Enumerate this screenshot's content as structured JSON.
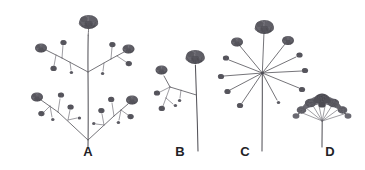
{
  "figure": {
    "background_color": "#ffffff",
    "ink_color": "#55545a",
    "head_color": "#6b6a71",
    "width": 365,
    "height": 170,
    "style": "grayscale pen-and-ink botanical line drawing"
  },
  "labels": [
    {
      "id": "A",
      "text": "A",
      "x": 88,
      "y": 156
    },
    {
      "id": "B",
      "text": "B",
      "x": 180,
      "y": 156
    },
    {
      "id": "C",
      "text": "C",
      "x": 245,
      "y": 156
    },
    {
      "id": "D",
      "text": "D",
      "x": 330,
      "y": 156
    }
  ],
  "specimens": [
    {
      "id": "A",
      "name": "compound-branched-inflorescence",
      "label": "A",
      "stem_base": {
        "x": 88,
        "y": 146
      },
      "stem_top": {
        "x": 88,
        "y": 36
      },
      "node_levels": 2,
      "terminal_head": {
        "x": 88,
        "y": 24,
        "size": 11
      },
      "branch_nodes": [
        {
          "x": 88,
          "y": 72,
          "spread": "opposite-pair"
        },
        {
          "x": 88,
          "y": 128,
          "spread": "opposite-pair"
        }
      ],
      "head_count": 14
    },
    {
      "id": "B",
      "name": "simple-branched-inflorescence",
      "label": "B",
      "stem_base": {
        "x": 198,
        "y": 150
      },
      "stem_top": {
        "x": 196,
        "y": 66
      },
      "terminal_head": {
        "x": 195,
        "y": 57,
        "size": 10
      },
      "branch_nodes": [
        {
          "x": 196,
          "y": 94,
          "spread": "single-left"
        }
      ],
      "head_count": 6
    },
    {
      "id": "C",
      "name": "simple-umbel",
      "label": "C",
      "hub": {
        "x": 262,
        "y": 73
      },
      "stem_base": {
        "x": 262,
        "y": 150
      },
      "ray_count": 11,
      "terminal_head": {
        "x": 264,
        "y": 27,
        "size": 11
      },
      "head_count": 11
    },
    {
      "id": "D",
      "name": "dense-compact-umbel",
      "label": "D",
      "stem_base": {
        "x": 322,
        "y": 146
      },
      "stem_top": {
        "x": 322,
        "y": 120
      },
      "arc_center": {
        "x": 322,
        "y": 122
      },
      "arc_radius": 27,
      "floret_count": 26
    }
  ]
}
